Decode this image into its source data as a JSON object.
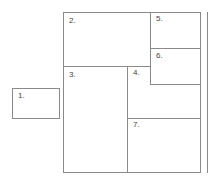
{
  "diagram": {
    "type": "layout-wireframe",
    "panels": [
      {
        "id": "1",
        "label": "1."
      },
      {
        "id": "2",
        "label": "2."
      },
      {
        "id": "3",
        "label": "3."
      },
      {
        "id": "4",
        "label": "4."
      },
      {
        "id": "5",
        "label": "5."
      },
      {
        "id": "6",
        "label": "6."
      },
      {
        "id": "7",
        "label": "7."
      }
    ],
    "line_color": "#8a8a8a"
  }
}
